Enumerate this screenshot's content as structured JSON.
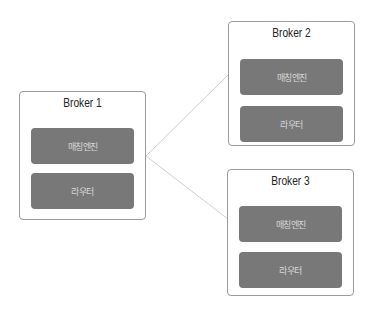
{
  "diagram": {
    "brokers": [
      {
        "id": "broker-1",
        "title": "Broker 1",
        "modules": [
          "매칭엔진",
          "라우터"
        ]
      },
      {
        "id": "broker-2",
        "title": "Broker 2",
        "modules": [
          "매칭엔진",
          "라우터"
        ]
      },
      {
        "id": "broker-3",
        "title": "Broker 3",
        "modules": [
          "매칭엔진",
          "라우터"
        ]
      }
    ],
    "connections": [
      {
        "from": "broker-1",
        "to": "broker-2"
      },
      {
        "from": "broker-1",
        "to": "broker-3"
      }
    ],
    "colors": {
      "border": "#9a9a9a",
      "module_fill": "#787878",
      "module_text": "#d8d8d8",
      "line": "#cfcfcf"
    }
  }
}
